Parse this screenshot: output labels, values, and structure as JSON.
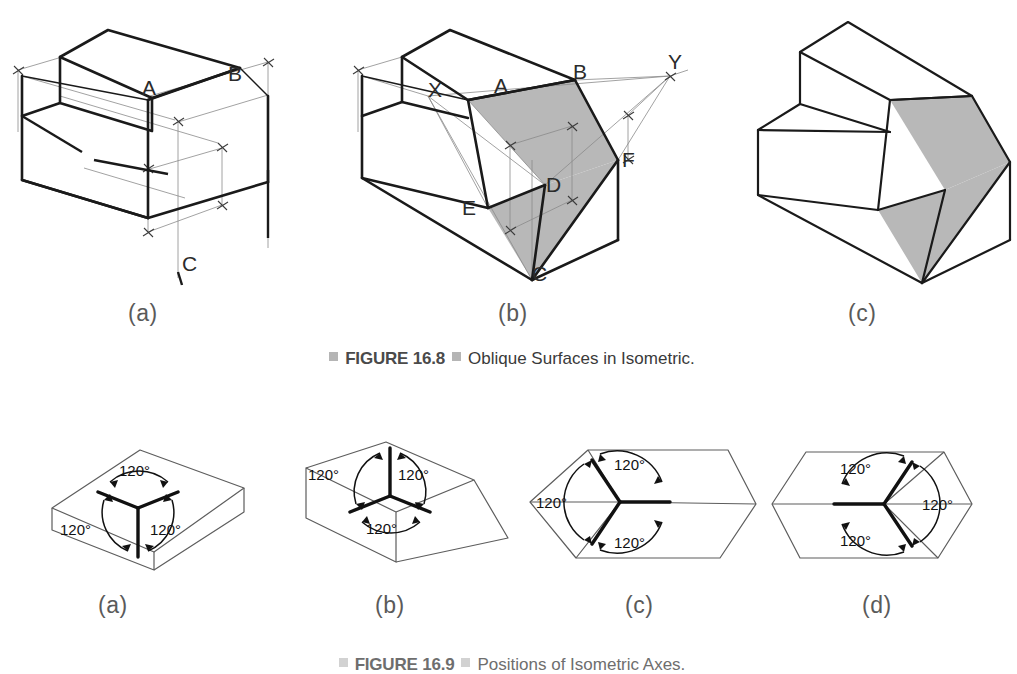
{
  "page": {
    "width": 1017,
    "height": 674,
    "background": "#ffffff"
  },
  "colors": {
    "outline_heavy": "#1a1a1a",
    "outline_light": "#6b6b6b",
    "construction_line": "#8a8a8a",
    "shaded_face": "#b8b8b8",
    "caption_text": "#3a3a3a",
    "caption_figno": "#4a4a4a",
    "caption_marker": "#b5b5b5",
    "sub_label": "#5a5a5a"
  },
  "figures": [
    {
      "id": "figure-16-8",
      "caption_number": "FIGURE 16.8",
      "caption_title": "Oblique Surfaces in Isometric.",
      "panels": [
        {
          "key": "a",
          "label": "(a)",
          "description": "Isometric block with stepped notch, construction dimension lines, points A, B and C located by offset measurements",
          "vertex_labels": [
            "A",
            "B",
            "C"
          ],
          "has_shaded_face": false,
          "has_construction_lines": true
        },
        {
          "key": "b",
          "label": "(b)",
          "description": "Same block with the oblique surface shaded and located by extending edges to piercing points X and Y; vertices A, B, C, D, E, F marked",
          "vertex_labels": [
            "X",
            "A",
            "B",
            "Y",
            "D",
            "F",
            "E",
            "C"
          ],
          "has_shaded_face": true,
          "has_construction_lines": true
        },
        {
          "key": "c",
          "label": "(c)",
          "description": "Finished isometric of the object with the oblique surface shaded, construction lines removed",
          "vertex_labels": [],
          "has_shaded_face": true,
          "has_construction_lines": false
        }
      ]
    },
    {
      "id": "figure-16-9",
      "caption_number": "FIGURE 16.9",
      "caption_title": "Positions of Isometric Axes.",
      "angle_label": "120°",
      "panels": [
        {
          "key": "a",
          "label": "(a)",
          "description": "Regular isometric axes: one axis vertical downward from the near top corner, two receding upward left and right; all three angles 120°",
          "angles": [
            "120°",
            "120°",
            "120°"
          ],
          "axis_orientation": "regular"
        },
        {
          "key": "b",
          "label": "(b)",
          "description": "Reversed axis position: one axis vertical upward from the near bottom corner, two receding downward left and right; all three angles 120°",
          "angles": [
            "120°",
            "120°",
            "120°"
          ],
          "axis_orientation": "reversed"
        },
        {
          "key": "c",
          "label": "(c)",
          "description": "Long axis horizontal to the right with two axes receding up-left and down-left; all three angles 120°",
          "angles": [
            "120°",
            "120°",
            "120°"
          ],
          "axis_orientation": "long-axis-right"
        },
        {
          "key": "d",
          "label": "(d)",
          "description": "Long axis horizontal to the left with two axes receding up-right and down-right; all three angles 120°",
          "angles": [
            "120°",
            "120°",
            "120°"
          ],
          "axis_orientation": "long-axis-left"
        }
      ]
    }
  ]
}
